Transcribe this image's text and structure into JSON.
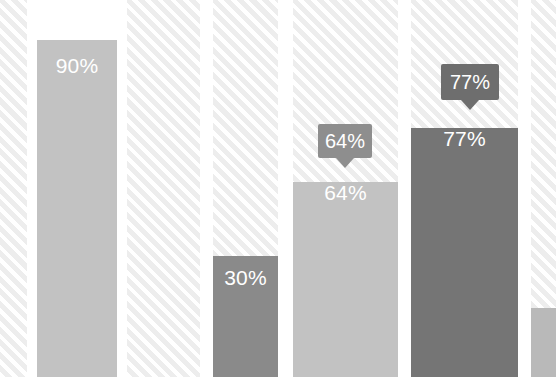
{
  "chart_data": {
    "type": "bar",
    "title": "",
    "subtitle": "",
    "xlabel": "",
    "ylabel": "",
    "ylim": [
      0,
      100
    ],
    "grid": false,
    "legend": "none",
    "categories": [
      "1",
      "2",
      "3",
      "4",
      "5"
    ],
    "values": [
      90,
      30,
      64,
      77,
      18
    ],
    "value_labels": [
      "90%",
      "30%",
      "64%",
      "77%",
      ""
    ],
    "label_style": [
      "inside",
      "inside",
      "tooltip",
      "tooltip",
      "none"
    ],
    "series": [
      {
        "name": "Percentage",
        "values": [
          90,
          30,
          64,
          77,
          18
        ]
      }
    ],
    "axis_visible": false,
    "background": "white with 45-degree diagonal hatched column bands"
  },
  "colors": {
    "bar_light": "#c2c2c2",
    "bar_medium": "#8a8a8a",
    "bar_dark": "#757575",
    "tooltip_medium": "#8e8e8e",
    "tooltip_dark": "#6e6e6e",
    "hatch_stripe": "#ededed",
    "background": "#ffffff",
    "label_text": "#ffffff"
  },
  "bars": [
    {
      "id": "bar-1",
      "label": "90%",
      "value": 90,
      "color": "#c2c2c2",
      "x": 37,
      "width": 80,
      "top": 40,
      "label_top": 55
    },
    {
      "id": "bar-2",
      "label": "30%",
      "value": 30,
      "color": "#8a8a8a",
      "x": 213,
      "width": 65,
      "top": 256,
      "label_top": 267
    },
    {
      "id": "bar-3",
      "label": "64%",
      "value": 64,
      "color": "#c2c2c2",
      "x": 293,
      "width": 105,
      "top": 182,
      "label_top": 0
    },
    {
      "id": "bar-4",
      "label": "77%",
      "value": 77,
      "color": "#757575",
      "x": 411,
      "width": 107,
      "top": 128,
      "label_top": 0
    },
    {
      "id": "bar-5",
      "label": "",
      "value": 18,
      "color": "#b9b9b9",
      "x": 531,
      "width": 25,
      "top": 308,
      "label_top": 0
    }
  ],
  "tooltips": [
    {
      "id": "tooltip-64",
      "label": "64%",
      "value": 64,
      "color": "#8e8e8e",
      "x": 318,
      "y": 124,
      "width": 54,
      "height": 34
    },
    {
      "id": "tooltip-77",
      "label": "77%",
      "value": 77,
      "color": "#6e6e6e",
      "x": 441,
      "y": 64,
      "width": 58,
      "height": 36
    }
  ],
  "hatch_columns": [
    {
      "x": 0,
      "width": 27
    },
    {
      "x": 127,
      "width": 73
    },
    {
      "x": 213,
      "width": 65
    },
    {
      "x": 293,
      "width": 105
    },
    {
      "x": 411,
      "width": 107
    },
    {
      "x": 531,
      "width": 25
    }
  ]
}
